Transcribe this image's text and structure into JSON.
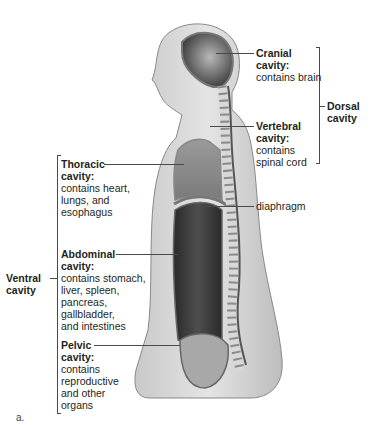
{
  "figure": {
    "panel_label": "a.",
    "groups": {
      "dorsal": "Dorsal cavity",
      "dorsal_line1": "Dorsal",
      "dorsal_line2": "cavity",
      "ventral_line1": "Ventral",
      "ventral_line2": "cavity"
    },
    "labels": {
      "cranial": {
        "title1": "Cranial",
        "title2": "cavity:",
        "desc1": "contains brain"
      },
      "vertebral": {
        "title1": "Vertebral",
        "title2": "cavity:",
        "desc1": "contains",
        "desc2": "spinal cord"
      },
      "thoracic": {
        "title1": "Thoracic",
        "title2": "cavity:",
        "desc1": "contains heart,",
        "desc2": "lungs, and",
        "desc3": "esophagus"
      },
      "diaphragm": {
        "text": "diaphragm"
      },
      "abdominal": {
        "title1": "Abdominal",
        "title2": "cavity:",
        "desc1": "contains stomach,",
        "desc2": "liver, spleen,",
        "desc3": "pancreas,",
        "desc4": "gallbladder,",
        "desc5": "and intestines"
      },
      "pelvic": {
        "title1": "Pelvic",
        "title2": "cavity:",
        "desc1": "contains",
        "desc2": "reproductive",
        "desc3": "and other",
        "desc4": "organs"
      }
    }
  }
}
